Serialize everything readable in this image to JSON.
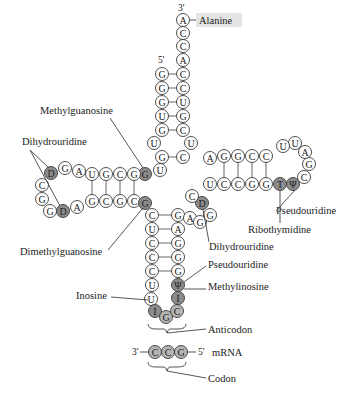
{
  "colors": {
    "plain_fill": "#ffffff",
    "modified_fill": "#8c8c8c",
    "codon_fill": "#b5b5b5",
    "alanine_highlight": "#e4e4e4",
    "stroke": "#3a3a3a"
  },
  "ends": {
    "three_prime": "3'",
    "five_prime": "5'",
    "mrna_three_prime": "3'",
    "mrna_five_prime": "5'"
  },
  "labels": {
    "alanine": "Alanine",
    "methylguanosine": "Methylguanosine",
    "dihydrouridine_left": "Dihydrouridine",
    "dimethylguanosine": "Dimethylguanosine",
    "inosine": "Inosine",
    "pseudouridine_t_loop": "Pseudouridine",
    "ribothymidine": "Ribothymidine",
    "dihydrouridine_right": "Dihydrouridine",
    "pseudouridine_anticodon": "Pseudouridine",
    "methylinosine": "Methylinosine",
    "anticodon": "Anticodon",
    "mrna": "mRNA",
    "codon": "Codon"
  },
  "nucleotides": {
    "acceptor_3prime_strand": [
      "A",
      "C",
      "C",
      "A",
      "C",
      "C",
      "U",
      "G",
      "C",
      "U",
      "C"
    ],
    "acceptor_5prime_strand": [
      "G",
      "G",
      "G",
      "U",
      "G",
      "U",
      "G",
      "U"
    ],
    "d_arm_top": [
      "G",
      "G",
      "C",
      "G",
      "U",
      "A",
      "G",
      "D"
    ],
    "d_loop": [
      "C",
      "G",
      "G"
    ],
    "d_arm_bottom": [
      "D",
      "A",
      "G",
      "C",
      "G",
      "C",
      "G"
    ],
    "anticodon_stem_left": [
      "C",
      "U",
      "C",
      "C",
      "C",
      "U",
      "U"
    ],
    "anticodon_loop": [
      "I",
      "G",
      "C"
    ],
    "anticodon_stem_right": [
      "I",
      "Ψ",
      "G",
      "G",
      "G",
      "A",
      "G"
    ],
    "variable_loop": [
      "A",
      "G",
      "G",
      "D",
      "C"
    ],
    "t_arm_bottom": [
      "U",
      "C",
      "C",
      "G",
      "G",
      "T",
      "Ψ"
    ],
    "t_loop": [
      "C",
      "G",
      "A"
    ],
    "t_arm_top": [
      "U",
      "U",
      "C",
      "C",
      "G",
      "G",
      "A"
    ],
    "codon": [
      "C",
      "C",
      "G"
    ]
  }
}
